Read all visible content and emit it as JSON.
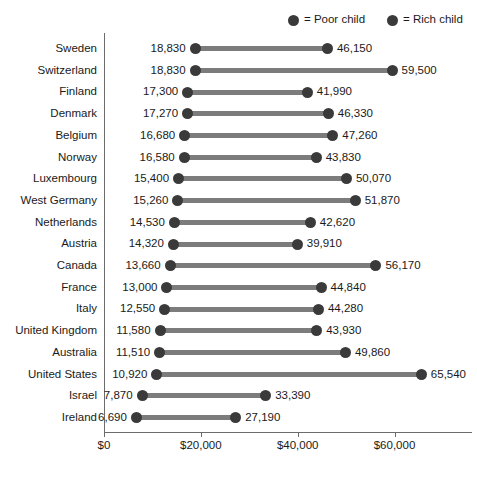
{
  "chart_data": {
    "type": "bar",
    "subtype": "dumbbell",
    "title": "",
    "xlabel": "Household income",
    "ylabel": "",
    "xlim": [
      0,
      76000
    ],
    "grid": false,
    "legend_position": "top-right",
    "legend": [
      {
        "marker": "poor-dot",
        "text": "= Poor child"
      },
      {
        "marker": "rich-dot",
        "text": "= Rich child"
      }
    ],
    "xticks": [
      0,
      20000,
      40000,
      60000
    ],
    "xticklabels": [
      "$0",
      "$20,000",
      "$40,000",
      "$60,000"
    ],
    "categories": [
      "Sweden",
      "Switzerland",
      "Finland",
      "Denmark",
      "Belgium",
      "Norway",
      "Luxembourg",
      "West Germany",
      "Netherlands",
      "Austria",
      "Canada",
      "France",
      "Italy",
      "United Kingdom",
      "Australia",
      "United States",
      "Israel",
      "Ireland"
    ],
    "series": [
      {
        "name": "Poor child",
        "values": [
          18830,
          18830,
          17300,
          17270,
          16680,
          16580,
          15400,
          15260,
          14530,
          14320,
          13660,
          13000,
          12550,
          11580,
          11510,
          10920,
          7870,
          6690
        ],
        "labels": [
          "18,830",
          "18,830",
          "17,300",
          "17,270",
          "16,680",
          "16,580",
          "15,400",
          "15,260",
          "14,530",
          "14,320",
          "13,660",
          "13,000",
          "12,550",
          "11,580",
          "11,510",
          "10,920",
          "7,870",
          "6,690"
        ]
      },
      {
        "name": "Rich child",
        "values": [
          46150,
          59500,
          41990,
          46330,
          47260,
          43830,
          50070,
          51870,
          42620,
          39910,
          56170,
          44840,
          44280,
          43930,
          49860,
          65540,
          33390,
          27190
        ],
        "labels": [
          "46,150",
          "59,500",
          "41,990",
          "46,330",
          "47,260",
          "43,830",
          "50,070",
          "51,870",
          "42,620",
          "39,910",
          "56,170",
          "44,840",
          "44,280",
          "43,930",
          "49,860",
          "65,540",
          "33,390",
          "27,190"
        ]
      }
    ],
    "colors": {
      "dot": "#3a3a3a",
      "connector": "#7c7c7c",
      "axis": "#6c6c6c",
      "text": "#1a1a1a",
      "background": "#ffffff"
    }
  }
}
